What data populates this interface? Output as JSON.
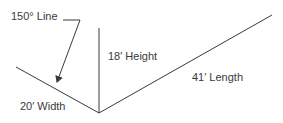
{
  "diagram": {
    "colors": {
      "line": "#3a3a3a",
      "text": "#3a3a3a",
      "background": "#ffffff"
    },
    "labels": {
      "angle_line": "150° Line",
      "height": "18′ Height",
      "length": "41′ Length",
      "width": "20′ Width"
    },
    "geometry": {
      "vertex": [
        99,
        113
      ],
      "height_top": [
        99,
        28
      ],
      "width_end": [
        16,
        67
      ],
      "length_end": [
        272,
        15
      ],
      "leader": {
        "start": [
          63,
          20
        ],
        "elbow": [
          80,
          20
        ],
        "arrow_tip": [
          57,
          82
        ]
      }
    }
  }
}
